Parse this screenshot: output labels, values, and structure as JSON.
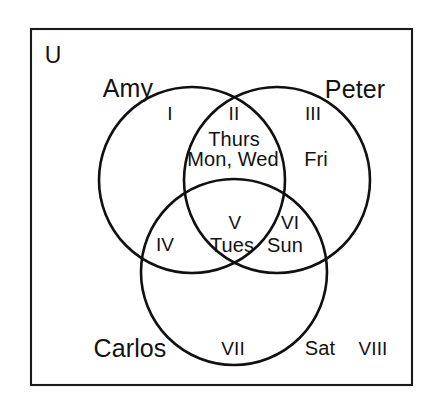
{
  "diagram": {
    "type": "venn",
    "set_count": 3,
    "universe_label": "U",
    "stroke_color": "#101010",
    "background_color": "#ffffff",
    "frame": {
      "x": 31,
      "y": 29,
      "width": 381,
      "height": 356
    },
    "sets": [
      {
        "name": "Amy",
        "label": "Amy",
        "label_x": 128,
        "label_y": 88,
        "circle": {
          "cx": 192,
          "cy": 180,
          "r": 93
        }
      },
      {
        "name": "Peter",
        "label": "Peter",
        "label_x": 355,
        "label_y": 89,
        "circle": {
          "cx": 277,
          "cy": 180,
          "r": 93
        }
      },
      {
        "name": "Carlos",
        "label": "Carlos",
        "label_x": 130,
        "label_y": 348,
        "circle": {
          "cx": 234,
          "cy": 272,
          "r": 93
        }
      }
    ],
    "regions": [
      {
        "numeral": "I",
        "belongs_to": [
          "Amy"
        ],
        "numeral_x": 170,
        "numeral_y": 113,
        "items": []
      },
      {
        "numeral": "II",
        "belongs_to": [
          "Amy",
          "Peter"
        ],
        "numeral_x": 234,
        "numeral_y": 113,
        "items": [
          "Thurs",
          "Mon, Wed"
        ]
      },
      {
        "numeral": "III",
        "belongs_to": [
          "Peter"
        ],
        "numeral_x": 313,
        "numeral_y": 113,
        "items": [
          "Fri"
        ]
      },
      {
        "numeral": "IV",
        "belongs_to": [
          "Amy",
          "Carlos"
        ],
        "numeral_x": 165,
        "numeral_y": 244,
        "items": []
      },
      {
        "numeral": "V",
        "belongs_to": [
          "Amy",
          "Peter",
          "Carlos"
        ],
        "numeral_x": 235,
        "numeral_y": 222,
        "items": [
          "Tues"
        ]
      },
      {
        "numeral": "VI",
        "belongs_to": [
          "Peter",
          "Carlos"
        ],
        "numeral_x": 290,
        "numeral_y": 222,
        "items": [
          "Sun"
        ]
      },
      {
        "numeral": "VII",
        "belongs_to": [
          "Carlos"
        ],
        "numeral_x": 233,
        "numeral_y": 348,
        "items": []
      },
      {
        "numeral": "VIII",
        "belongs_to": [],
        "numeral_x": 373,
        "numeral_y": 348,
        "items": [
          "Sat"
        ]
      }
    ],
    "item_labels": [
      {
        "text": "Thurs",
        "x": 234,
        "y": 139,
        "region": "II"
      },
      {
        "text": "Mon, Wed",
        "x": 233,
        "y": 159,
        "region": "II"
      },
      {
        "text": "Fri",
        "x": 316,
        "y": 159,
        "region": "III"
      },
      {
        "text": "Tues",
        "x": 232,
        "y": 245,
        "region": "V"
      },
      {
        "text": "Sun",
        "x": 285,
        "y": 245,
        "region": "VI"
      },
      {
        "text": "Sat",
        "x": 320,
        "y": 348,
        "region": "VIII"
      }
    ]
  }
}
